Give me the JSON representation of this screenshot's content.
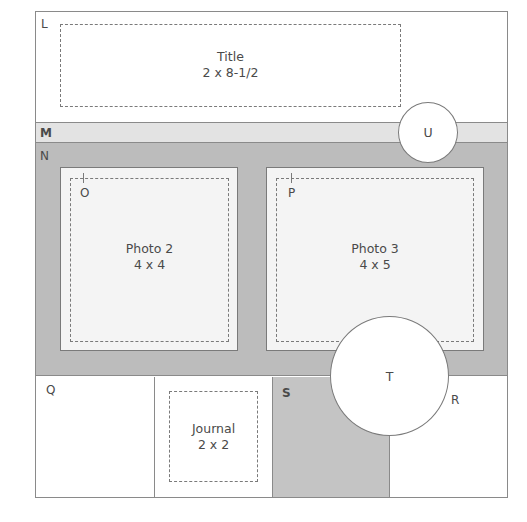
{
  "diagram": {
    "type": "scrapbook-page-layout-sketch",
    "regions": {
      "L": {
        "label": "L"
      },
      "M": {
        "label": "M"
      },
      "N": {
        "label": "N"
      },
      "O": {
        "label": "O"
      },
      "P": {
        "label": "P"
      },
      "Q": {
        "label": "Q"
      },
      "R": {
        "label": "R"
      },
      "S": {
        "label": "S"
      },
      "T": {
        "label": "T"
      },
      "U": {
        "label": "U"
      }
    },
    "title_box": {
      "line1": "Title",
      "line2": "2 x 8-1/2"
    },
    "photo2": {
      "line1": "Photo 2",
      "line2": "4 x 4"
    },
    "photo3": {
      "line1": "Photo 3",
      "line2": "4 x 5"
    },
    "journal": {
      "line1": "Journal",
      "line2": "2 x 2"
    },
    "colors": {
      "outline": "#8a8a8a",
      "band_m": "#e3e3e3",
      "band_n": "#bcbcbc",
      "mat": "#f4f4f4",
      "text": "#4a4a4a"
    }
  }
}
